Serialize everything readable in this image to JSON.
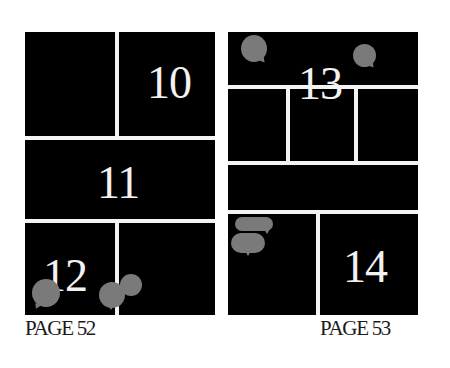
{
  "pages": [
    {
      "label": "PAGE 52",
      "panels": [
        {
          "id": "left-top-left",
          "number": ""
        },
        {
          "id": "left-top-right",
          "number": "10"
        },
        {
          "id": "left-middle",
          "number": "11"
        },
        {
          "id": "left-bottom-left",
          "number": "12"
        },
        {
          "id": "left-bottom-right",
          "number": ""
        }
      ]
    },
    {
      "label": "PAGE 53",
      "panels": [
        {
          "id": "right-top",
          "number": "13"
        },
        {
          "id": "right-row2-left",
          "number": ""
        },
        {
          "id": "right-row2-middle",
          "number": ""
        },
        {
          "id": "right-row2-right",
          "number": ""
        },
        {
          "id": "right-wide-strip",
          "number": ""
        },
        {
          "id": "right-bottom-left",
          "number": ""
        },
        {
          "id": "right-bottom-right",
          "number": "14"
        }
      ]
    }
  ],
  "colors": {
    "panel": "#000000",
    "gutter": "#f4f4f4",
    "panel_number": "#f2f2f2",
    "speech_bubble": "#7a7a7a",
    "label_text": "#1a1a1a"
  }
}
